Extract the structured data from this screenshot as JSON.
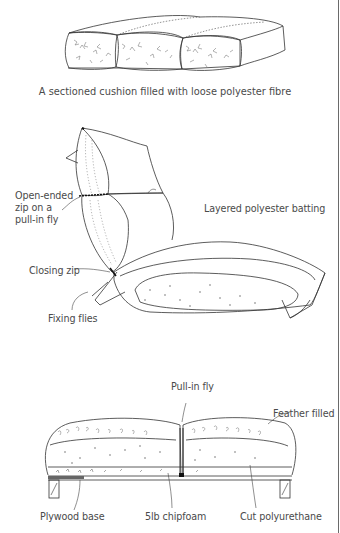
{
  "figures": [
    {
      "id": "sectioned-cushion",
      "caption": "A sectioned cushion filled with loose polyester fibre"
    },
    {
      "id": "seat-back-cushion",
      "labels": {
        "zip": [
          "Open-ended",
          "zip on a",
          "pull-in fly"
        ],
        "batting": "Layered polyester batting",
        "closing_zip": "Closing zip",
        "fixing_flies": "Fixing flies"
      }
    },
    {
      "id": "feather-cushion-section",
      "labels": {
        "pull_in_fly": "Pull-in fly",
        "feather_filled": "Feather filled",
        "plywood_base": "Plywood base",
        "chipfoam": "5lb chipfoam",
        "polyurethane": "Cut polyurethane"
      }
    }
  ]
}
